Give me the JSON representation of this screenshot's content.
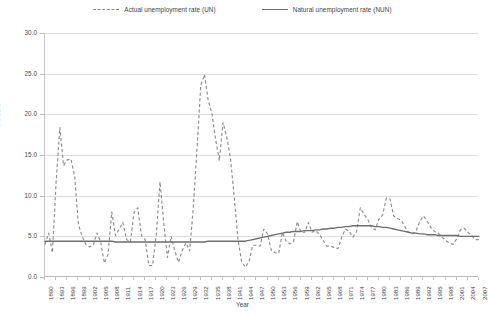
{
  "legend": {
    "items": [
      {
        "label": "Actual unemployment rate (UN)",
        "style": "dashed",
        "color": "#8d8d8d",
        "icon": "dashed-line-swatch"
      },
      {
        "label": "Natural unemployment rate (NUN)",
        "style": "solid",
        "color": "#6e6e6e",
        "icon": "solid-line-swatch"
      }
    ]
  },
  "axes": {
    "ylabel": "Percent",
    "xlabel": "Year",
    "yticks": [
      "0.0",
      "5.0",
      "10.0",
      "15.0",
      "20.0",
      "25.0",
      "30.0"
    ],
    "xticks": [
      "1890",
      "1893",
      "1896",
      "1899",
      "1902",
      "1905",
      "1908",
      "1911",
      "1914",
      "1917",
      "1920",
      "1923",
      "1926",
      "1929",
      "1932",
      "1935",
      "1938",
      "1941",
      "1944",
      "1947",
      "1950",
      "1953",
      "1956",
      "1959",
      "1962",
      "1965",
      "1968",
      "1971",
      "1974",
      "1977",
      "1980",
      "1983",
      "1986",
      "1989",
      "1992",
      "1995",
      "1998",
      "2001",
      "2004",
      "2007"
    ]
  },
  "chart_data": {
    "type": "line",
    "title": "",
    "xlabel": "Year",
    "ylabel": "Percent",
    "ylim": [
      0,
      30
    ],
    "xlim": [
      1890,
      2007
    ],
    "ytick_step": 5,
    "xtick_step": 3,
    "grid": true,
    "legend_position": "top-center",
    "x": [
      1890,
      1891,
      1892,
      1893,
      1894,
      1895,
      1896,
      1897,
      1898,
      1899,
      1900,
      1901,
      1902,
      1903,
      1904,
      1905,
      1906,
      1907,
      1908,
      1909,
      1910,
      1911,
      1912,
      1913,
      1914,
      1915,
      1916,
      1917,
      1918,
      1919,
      1920,
      1921,
      1922,
      1923,
      1924,
      1925,
      1926,
      1927,
      1928,
      1929,
      1930,
      1931,
      1932,
      1933,
      1934,
      1935,
      1936,
      1937,
      1938,
      1939,
      1940,
      1941,
      1942,
      1943,
      1944,
      1945,
      1946,
      1947,
      1948,
      1949,
      1950,
      1951,
      1952,
      1953,
      1954,
      1955,
      1956,
      1957,
      1958,
      1959,
      1960,
      1961,
      1962,
      1963,
      1964,
      1965,
      1966,
      1967,
      1968,
      1969,
      1970,
      1971,
      1972,
      1973,
      1974,
      1975,
      1976,
      1977,
      1978,
      1979,
      1980,
      1981,
      1982,
      1983,
      1984,
      1985,
      1986,
      1987,
      1988,
      1989,
      1990,
      1991,
      1992,
      1993,
      1994,
      1995,
      1996,
      1997,
      1998,
      1999,
      2000,
      2001,
      2002,
      2003,
      2004,
      2005,
      2006,
      2007
    ],
    "series": [
      {
        "name": "Actual unemployment rate (UN)",
        "style": "dashed",
        "color": "#8d8d8d",
        "values": [
          4.0,
          5.4,
          3.0,
          11.7,
          18.4,
          13.7,
          14.4,
          14.5,
          12.4,
          6.5,
          5.0,
          4.0,
          3.7,
          3.9,
          5.4,
          4.3,
          1.7,
          2.8,
          8.0,
          5.1,
          5.9,
          6.7,
          4.6,
          4.3,
          7.9,
          8.5,
          5.1,
          4.6,
          1.4,
          1.4,
          5.2,
          11.7,
          6.7,
          2.4,
          5.0,
          3.2,
          1.8,
          3.3,
          4.2,
          3.2,
          8.7,
          15.9,
          23.6,
          24.9,
          21.7,
          20.1,
          16.9,
          14.3,
          19.0,
          17.2,
          14.6,
          9.9,
          4.7,
          1.9,
          1.2,
          1.9,
          3.9,
          3.9,
          3.8,
          5.9,
          5.3,
          3.3,
          3.0,
          2.9,
          5.5,
          4.4,
          4.1,
          4.3,
          6.8,
          5.5,
          5.5,
          6.7,
          5.5,
          5.7,
          5.2,
          4.5,
          3.8,
          3.8,
          3.6,
          3.5,
          4.9,
          5.9,
          5.6,
          4.9,
          5.6,
          8.5,
          7.7,
          7.1,
          6.1,
          5.8,
          7.1,
          7.6,
          9.7,
          9.6,
          7.5,
          7.2,
          7.0,
          6.2,
          5.5,
          5.3,
          5.6,
          6.8,
          7.5,
          6.9,
          6.1,
          5.6,
          5.4,
          4.9,
          4.5,
          4.2,
          4.0,
          4.7,
          5.8,
          6.0,
          5.5,
          5.1,
          4.6,
          4.6
        ]
      },
      {
        "name": "Natural unemployment rate (NUN)",
        "style": "solid",
        "color": "#6e6e6e",
        "values": [
          4.4,
          4.4,
          4.4,
          4.4,
          4.4,
          4.4,
          4.4,
          4.4,
          4.4,
          4.4,
          4.4,
          4.4,
          4.4,
          4.4,
          4.4,
          4.4,
          4.4,
          4.4,
          4.4,
          4.3,
          4.3,
          4.3,
          4.3,
          4.3,
          4.3,
          4.3,
          4.3,
          4.3,
          4.3,
          4.3,
          4.3,
          4.3,
          4.3,
          4.3,
          4.3,
          4.3,
          4.3,
          4.3,
          4.3,
          4.3,
          4.3,
          4.3,
          4.3,
          4.3,
          4.4,
          4.4,
          4.4,
          4.4,
          4.4,
          4.4,
          4.4,
          4.4,
          4.4,
          4.4,
          4.4,
          4.5,
          4.6,
          4.7,
          4.8,
          4.9,
          5.0,
          5.1,
          5.2,
          5.3,
          5.4,
          5.5,
          5.5,
          5.6,
          5.6,
          5.6,
          5.7,
          5.7,
          5.7,
          5.8,
          5.8,
          5.9,
          5.9,
          6.0,
          6.0,
          6.1,
          6.1,
          6.2,
          6.2,
          6.3,
          6.3,
          6.3,
          6.3,
          6.3,
          6.3,
          6.2,
          6.2,
          6.1,
          6.1,
          6.0,
          5.9,
          5.8,
          5.7,
          5.6,
          5.5,
          5.4,
          5.4,
          5.3,
          5.3,
          5.2,
          5.2,
          5.2,
          5.1,
          5.1,
          5.1,
          5.1,
          5.1,
          5.1,
          5.0,
          5.0,
          5.0,
          5.0,
          5.0,
          5.0
        ]
      }
    ]
  }
}
